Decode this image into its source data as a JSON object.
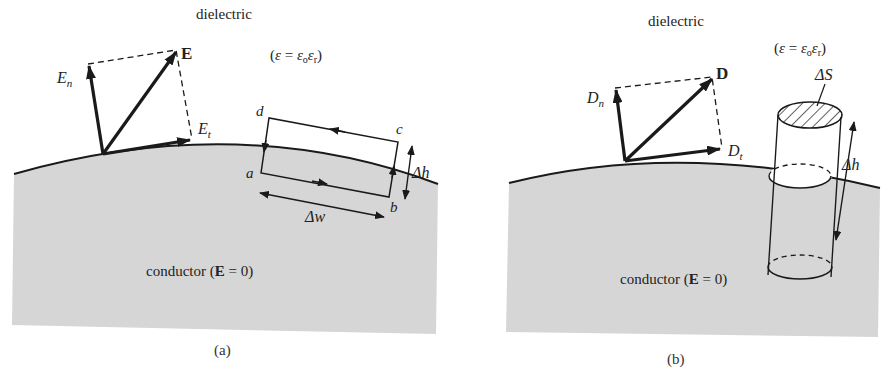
{
  "panel_a": {
    "medium_top": "dielectric",
    "permittivity": {
      "open": "(",
      "eps": "ε",
      "eq": " = ",
      "eps0": "ε",
      "sub0": "o",
      "epsr": "ε",
      "subr": "r",
      "close": ")"
    },
    "vector_main": "E",
    "vector_normal": {
      "base": "E",
      "sub": "n"
    },
    "vector_tangential": {
      "base": "E",
      "sub": "t"
    },
    "loop_corners": {
      "a": "a",
      "b": "b",
      "c": "c",
      "d": "d"
    },
    "height_label": "Δh",
    "width_label": "Δw",
    "conductor_label": {
      "pre": "conductor (",
      "bold": "E",
      "post": " = 0)"
    },
    "caption": "(a)"
  },
  "panel_b": {
    "medium_top": "dielectric",
    "permittivity": {
      "open": "(",
      "eps": "ε",
      "eq": " = ",
      "eps0": "ε",
      "sub0": "o",
      "epsr": "ε",
      "subr": "r",
      "close": ")"
    },
    "vector_main": "D",
    "vector_normal": {
      "base": "D",
      "sub": "n"
    },
    "vector_tangential": {
      "base": "D",
      "sub": "t"
    },
    "surface_label": "ΔS",
    "height_label": "Δh",
    "conductor_label": {
      "pre": "conductor (",
      "bold": "E",
      "post": " = 0)"
    },
    "caption": "(b)"
  },
  "colors": {
    "conductor_fill": "#d6d6d6",
    "line": "#1a1a1a",
    "background": "#ffffff"
  }
}
